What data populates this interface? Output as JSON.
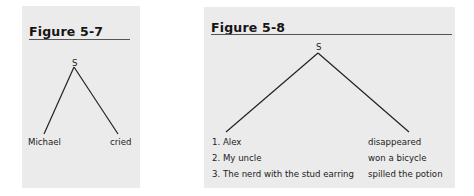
{
  "figures": [
    {
      "title": "Figure 5-7",
      "root": "S",
      "left_leaf": "Michael",
      "right_leaf": "cried"
    },
    {
      "title": "Figure 5-8",
      "root": "S",
      "subjects": [
        "1.  Alex",
        "2. My uncle",
        "3. The nerd with the stud earring"
      ],
      "predicates": [
        "disappeared",
        "won a bicycle",
        "spilled the potion"
      ]
    }
  ]
}
